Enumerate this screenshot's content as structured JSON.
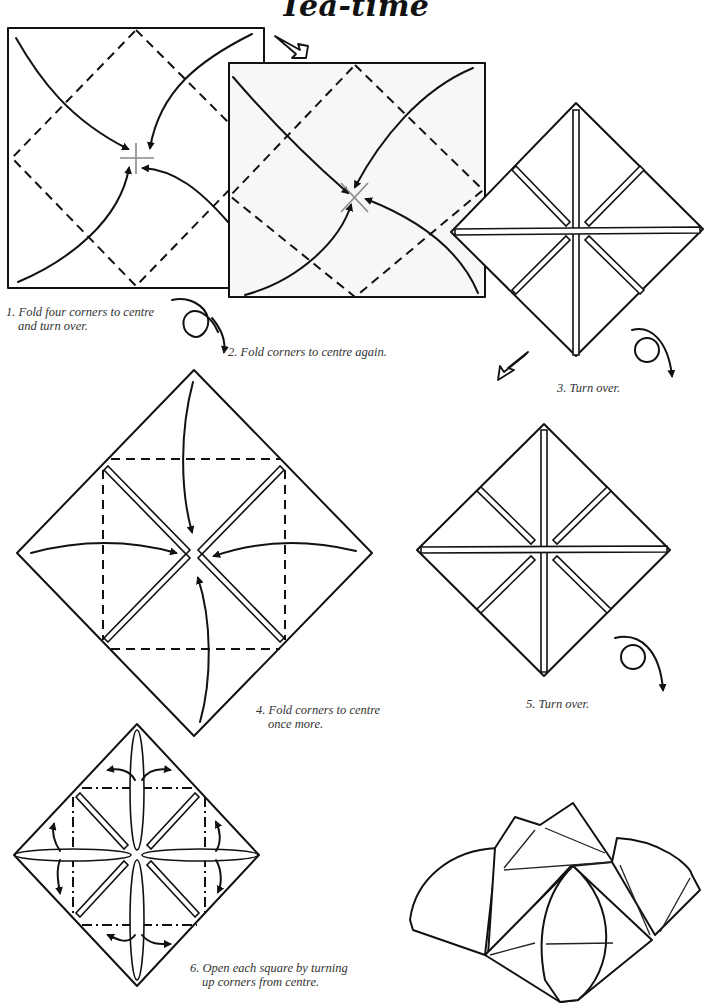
{
  "page": {
    "title": "Tea-time"
  },
  "steps": [
    {
      "number": "1.",
      "line1": "1. Fold four corners to centre",
      "line2": "and turn over.",
      "icon": "turn-over-icon"
    },
    {
      "number": "2.",
      "line1": "2. Fold corners to centre again.",
      "line2": "",
      "icon": "valley-fold-arrows"
    },
    {
      "number": "3.",
      "line1": "3. Turn over.",
      "line2": "",
      "icon": "turn-over-icon"
    },
    {
      "number": "4.",
      "line1": "4. Fold corners to centre",
      "line2": "once more.",
      "icon": "valley-fold-arrows"
    },
    {
      "number": "5.",
      "line1": "5. Turn over.",
      "line2": "",
      "icon": "turn-over-icon"
    },
    {
      "number": "6.",
      "line1": "6. Open each square by turning",
      "line2": "up corners from centre.",
      "icon": "open-out-arrows"
    }
  ],
  "legend": {
    "dashed_line": "valley-fold",
    "dash_dot_line": "mountain-fold",
    "loop_arrow": "turn-over",
    "hollow_arrow": "next-step"
  },
  "colors": {
    "ink": "#111111",
    "paper": "#ffffff",
    "paper_shaded": "#f7f7f7",
    "caption_text": "#333333"
  }
}
